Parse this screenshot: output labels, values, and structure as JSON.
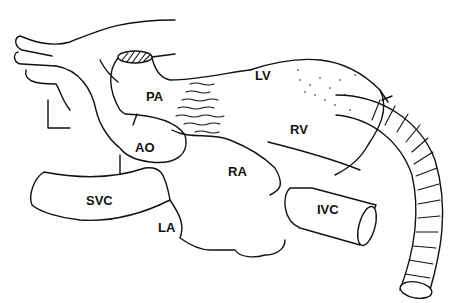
{
  "diagram": {
    "labels": [
      {
        "id": "pa",
        "text": "PA",
        "x": 146,
        "y": 89
      },
      {
        "id": "ao",
        "text": "AO",
        "x": 135,
        "y": 140
      },
      {
        "id": "lv",
        "text": "LV",
        "x": 255,
        "y": 68
      },
      {
        "id": "rv",
        "text": "RV",
        "x": 290,
        "y": 122
      },
      {
        "id": "ra",
        "text": "RA",
        "x": 228,
        "y": 164
      },
      {
        "id": "svc",
        "text": "SVC",
        "x": 86,
        "y": 193
      },
      {
        "id": "la",
        "text": "LA",
        "x": 158,
        "y": 220
      },
      {
        "id": "ivc",
        "text": "IVC",
        "x": 317,
        "y": 202
      }
    ]
  }
}
